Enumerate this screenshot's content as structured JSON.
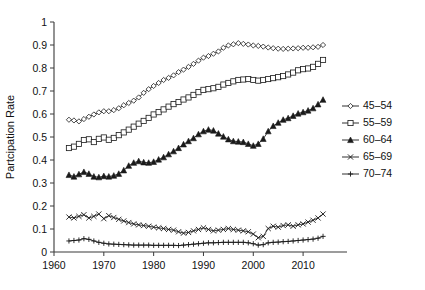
{
  "chart_data": {
    "type": "line",
    "title": "",
    "xlabel": "",
    "ylabel": "Partcipation Rate",
    "xlim": [
      1960,
      2016
    ],
    "ylim": [
      0,
      1
    ],
    "xticks": [
      1960,
      1970,
      1980,
      1990,
      2000,
      2010
    ],
    "yticks": [
      0,
      0.1,
      0.2,
      0.3,
      0.4,
      0.5,
      0.6,
      0.7,
      0.8,
      0.9,
      1
    ],
    "ytick_labels": [
      "0",
      "0.1",
      "0.2",
      "0.3",
      "0.4",
      "0.5",
      "0.6",
      "0.7",
      "0.8",
      "0.9",
      "1"
    ],
    "xtick_labels": [
      "1960",
      "1970",
      "1980",
      "1990",
      "2000",
      "2010"
    ],
    "grid": false,
    "legend_position": "right",
    "x": [
      1963,
      1964,
      1965,
      1966,
      1967,
      1968,
      1969,
      1970,
      1971,
      1972,
      1973,
      1974,
      1975,
      1976,
      1977,
      1978,
      1979,
      1980,
      1981,
      1982,
      1983,
      1984,
      1985,
      1986,
      1987,
      1988,
      1989,
      1990,
      1991,
      1992,
      1993,
      1994,
      1995,
      1996,
      1997,
      1998,
      1999,
      2000,
      2001,
      2002,
      2003,
      2004,
      2005,
      2006,
      2007,
      2008,
      2009,
      2010,
      2011,
      2012,
      2013,
      2014
    ],
    "series": [
      {
        "name": "45-54",
        "marker": "open-diamond",
        "values": [
          0.575,
          0.572,
          0.568,
          0.578,
          0.588,
          0.598,
          0.607,
          0.612,
          0.612,
          0.617,
          0.625,
          0.638,
          0.648,
          0.658,
          0.672,
          0.692,
          0.708,
          0.722,
          0.735,
          0.748,
          0.757,
          0.768,
          0.782,
          0.793,
          0.805,
          0.818,
          0.832,
          0.845,
          0.852,
          0.862,
          0.872,
          0.888,
          0.898,
          0.903,
          0.908,
          0.905,
          0.902,
          0.898,
          0.896,
          0.893,
          0.889,
          0.886,
          0.884,
          0.883,
          0.884,
          0.885,
          0.886,
          0.888,
          0.888,
          0.89,
          0.892,
          0.9
        ]
      },
      {
        "name": "55-59",
        "marker": "open-square",
        "values": [
          0.452,
          0.458,
          0.47,
          0.487,
          0.49,
          0.478,
          0.492,
          0.498,
          0.488,
          0.496,
          0.508,
          0.52,
          0.532,
          0.545,
          0.558,
          0.57,
          0.583,
          0.598,
          0.608,
          0.62,
          0.632,
          0.643,
          0.652,
          0.663,
          0.672,
          0.683,
          0.695,
          0.705,
          0.708,
          0.712,
          0.718,
          0.728,
          0.735,
          0.742,
          0.748,
          0.75,
          0.752,
          0.748,
          0.745,
          0.748,
          0.752,
          0.756,
          0.76,
          0.765,
          0.772,
          0.78,
          0.79,
          0.795,
          0.798,
          0.805,
          0.818,
          0.835
        ]
      },
      {
        "name": "60-64",
        "marker": "solid-triangle",
        "values": [
          0.335,
          0.328,
          0.338,
          0.348,
          0.34,
          0.328,
          0.325,
          0.33,
          0.328,
          0.332,
          0.34,
          0.355,
          0.375,
          0.388,
          0.395,
          0.39,
          0.388,
          0.392,
          0.402,
          0.412,
          0.425,
          0.438,
          0.452,
          0.468,
          0.482,
          0.495,
          0.512,
          0.525,
          0.532,
          0.528,
          0.515,
          0.502,
          0.49,
          0.482,
          0.48,
          0.478,
          0.47,
          0.462,
          0.47,
          0.492,
          0.525,
          0.548,
          0.562,
          0.575,
          0.582,
          0.592,
          0.602,
          0.608,
          0.615,
          0.625,
          0.642,
          0.662
        ]
      },
      {
        "name": "65-69",
        "marker": "x-cross",
        "values": [
          0.152,
          0.148,
          0.155,
          0.162,
          0.148,
          0.155,
          0.165,
          0.145,
          0.158,
          0.15,
          0.142,
          0.135,
          0.128,
          0.122,
          0.118,
          0.115,
          0.112,
          0.108,
          0.105,
          0.102,
          0.098,
          0.095,
          0.088,
          0.082,
          0.085,
          0.092,
          0.098,
          0.105,
          0.098,
          0.092,
          0.095,
          0.098,
          0.102,
          0.098,
          0.095,
          0.092,
          0.088,
          0.078,
          0.062,
          0.068,
          0.102,
          0.112,
          0.108,
          0.115,
          0.118,
          0.112,
          0.118,
          0.122,
          0.13,
          0.138,
          0.148,
          0.165
        ]
      },
      {
        "name": "70-74",
        "marker": "plus",
        "values": [
          0.048,
          0.05,
          0.052,
          0.058,
          0.055,
          0.048,
          0.042,
          0.038,
          0.035,
          0.034,
          0.033,
          0.032,
          0.031,
          0.03,
          0.03,
          0.03,
          0.03,
          0.029,
          0.029,
          0.029,
          0.029,
          0.029,
          0.028,
          0.03,
          0.032,
          0.034,
          0.036,
          0.038,
          0.04,
          0.04,
          0.041,
          0.042,
          0.042,
          0.042,
          0.042,
          0.042,
          0.04,
          0.036,
          0.03,
          0.032,
          0.04,
          0.042,
          0.043,
          0.045,
          0.046,
          0.048,
          0.05,
          0.052,
          0.054,
          0.056,
          0.06,
          0.068
        ]
      }
    ],
    "legend_entries": [
      {
        "label": "45–54",
        "marker": "open-diamond"
      },
      {
        "label": "55–59",
        "marker": "open-square"
      },
      {
        "label": "60–64",
        "marker": "solid-triangle"
      },
      {
        "label": "65–69",
        "marker": "x-cross"
      },
      {
        "label": "70–74",
        "marker": "plus"
      }
    ]
  }
}
